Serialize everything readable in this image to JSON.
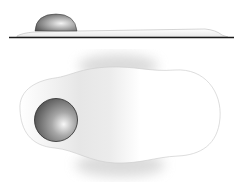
{
  "diagram": {
    "views": [
      {
        "name": "side-view",
        "description": "fried egg on pan surface, profile"
      },
      {
        "name": "top-view",
        "description": "fried egg seen from above"
      }
    ],
    "colors": {
      "background": "#ffffff",
      "pan_line": "#1a1a1a",
      "white_outline": "#c8c8c8",
      "white_shadow": "#d6d6d6",
      "yolk_dark": "#4a4a4a",
      "yolk_mid": "#9a9a9a",
      "yolk_light": "#f2f2f2"
    }
  }
}
